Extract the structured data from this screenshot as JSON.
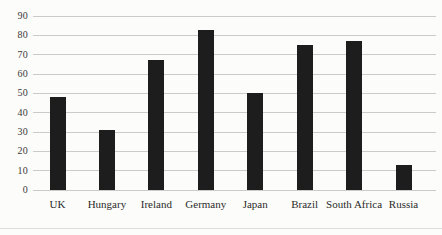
{
  "figure": {
    "background_color": "#fcfcfb",
    "bottom_rule_color": "#dddddb"
  },
  "chart_data": {
    "type": "bar",
    "categories": [
      "UK",
      "Hungary",
      "Ireland",
      "Germany",
      "Japan",
      "Brazil",
      "South Africa",
      "Russia"
    ],
    "values": [
      48,
      31,
      67,
      83,
      50,
      75,
      77,
      13
    ],
    "title": "",
    "xlabel": "",
    "ylabel": "",
    "ylim": [
      0,
      90
    ],
    "yticks": [
      0,
      10,
      20,
      30,
      40,
      50,
      60,
      70,
      80,
      90
    ],
    "grid": true,
    "legend": false,
    "legend_position": "none",
    "bar_color": "#1d1d1d",
    "gridline_color": "#cbcbc9",
    "tick_label_color": "#3a3a38",
    "category_label_color": "#2b2b29"
  }
}
